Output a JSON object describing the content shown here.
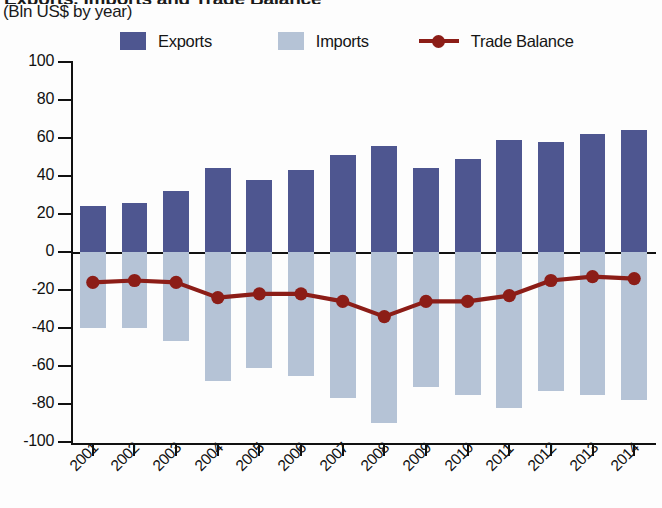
{
  "title": {
    "main_clipped": "Exports, Imports and Trade Balance",
    "subtitle": "(Bln US$ by year)"
  },
  "legend": {
    "exports_label": "Exports",
    "imports_label": "Imports",
    "balance_label": "Trade Balance"
  },
  "colors": {
    "exports": "#4e5690",
    "imports": "#b5c3d6",
    "trade_balance": "#8c1d17",
    "axis": "#111111",
    "background": "#fdfdfd"
  },
  "axis": {
    "y_ticks": [
      "100",
      "80",
      "60",
      "40",
      "20",
      "0",
      "-20",
      "-40",
      "-60",
      "-80",
      "-100"
    ],
    "y_min": -100,
    "y_max": 100,
    "y_step": 20
  },
  "chart_data": {
    "type": "bar",
    "title": "Exports, Imports and Trade Balance",
    "subtitle": "(Bln US$ by year)",
    "xlabel": "",
    "ylabel": "Bln US$",
    "ylim": [
      -100,
      100
    ],
    "ytick_step": 20,
    "grid": false,
    "legend_position": "top",
    "categories": [
      "2001",
      "2002",
      "2003",
      "2004",
      "2005",
      "2006",
      "2007",
      "2008",
      "2009",
      "2010",
      "2011",
      "2012",
      "2013",
      "2014"
    ],
    "series": [
      {
        "name": "Exports",
        "type": "bar",
        "color": "#4e5690",
        "values": [
          24,
          26,
          32,
          44,
          38,
          43,
          51,
          56,
          44,
          49,
          59,
          58,
          62,
          64
        ]
      },
      {
        "name": "Imports",
        "type": "bar",
        "color": "#b5c3d6",
        "values": [
          -40,
          -40,
          -47,
          -68,
          -61,
          -65,
          -77,
          -90,
          -71,
          -75,
          -82,
          -73,
          -75,
          -78
        ]
      },
      {
        "name": "Trade Balance",
        "type": "line",
        "color": "#8c1d17",
        "marker": "circle",
        "values": [
          -16,
          -15,
          -16,
          -24,
          -22,
          -22,
          -26,
          -34,
          -26,
          -26,
          -23,
          -15,
          -13,
          -14
        ]
      }
    ]
  }
}
